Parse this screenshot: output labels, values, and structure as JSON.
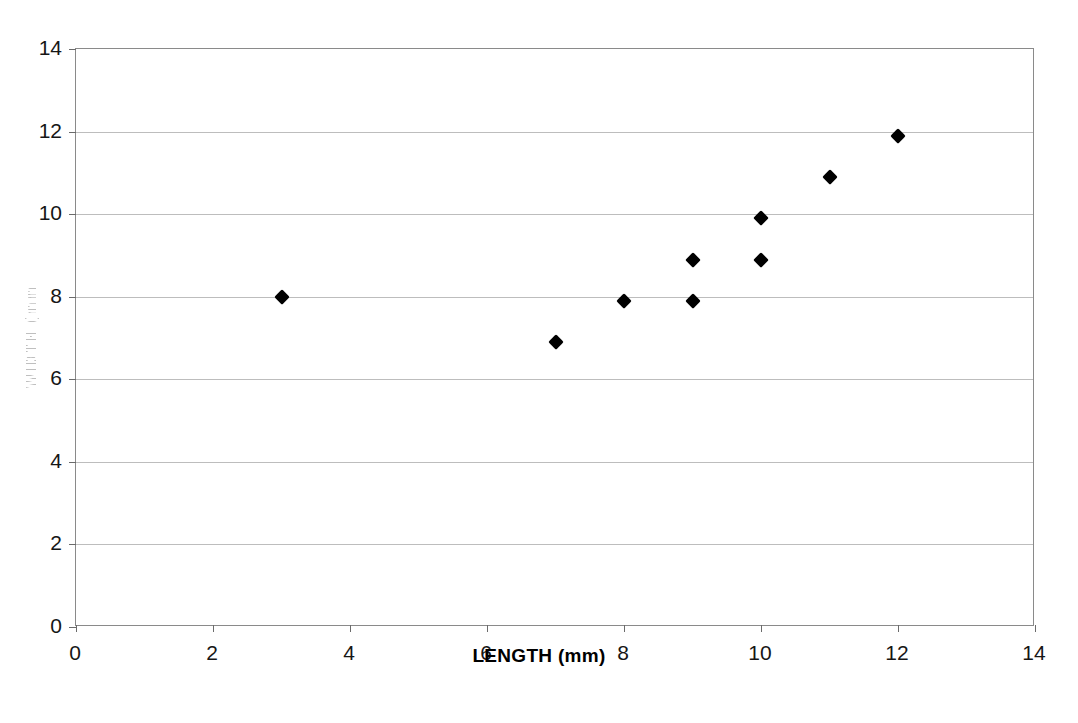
{
  "chart_data": {
    "type": "scatter",
    "title": "",
    "xlabel": "LENGTH (mm)",
    "ylabel": "WIDTH (mm)",
    "xlim": [
      0,
      14
    ],
    "ylim": [
      0,
      14
    ],
    "xticks": [
      0,
      2,
      4,
      6,
      8,
      10,
      12,
      14
    ],
    "yticks": [
      0,
      2,
      4,
      6,
      8,
      10,
      12,
      14
    ],
    "xtick_labels": [
      "0",
      "2",
      "4",
      "6",
      "8",
      "10",
      "12",
      "14"
    ],
    "ytick_labels": [
      "0",
      "2",
      "4",
      "6",
      "8",
      "10",
      "12",
      "14"
    ],
    "grid": "horizontal",
    "legend": "none",
    "marker": "filled-diamond",
    "marker_color": "#000000",
    "gridline_color": "#bdbdbd",
    "axis_color": "#8a8a8a",
    "points": [
      {
        "x": 3,
        "y": 8.0
      },
      {
        "x": 7,
        "y": 6.9
      },
      {
        "x": 8,
        "y": 7.9
      },
      {
        "x": 9,
        "y": 7.9
      },
      {
        "x": 9,
        "y": 8.9
      },
      {
        "x": 10,
        "y": 8.9
      },
      {
        "x": 10,
        "y": 9.9
      },
      {
        "x": 11,
        "y": 10.9
      },
      {
        "x": 12,
        "y": 11.9
      }
    ],
    "series": [
      {
        "name": "observations",
        "x": [
          3,
          7,
          8,
          9,
          9,
          10,
          10,
          11,
          12
        ],
        "values": [
          8.0,
          6.9,
          7.9,
          7.9,
          8.9,
          8.9,
          9.9,
          10.9,
          11.9
        ]
      }
    ]
  }
}
